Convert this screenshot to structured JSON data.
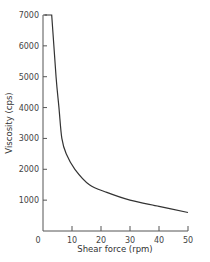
{
  "chart_data": {
    "type": "line",
    "title": "",
    "xlabel": "Shear force (rpm)",
    "ylabel": "Viscosity (cps)",
    "xlim": [
      0,
      50
    ],
    "ylim": [
      0,
      7000
    ],
    "x_ticks": [
      0,
      10,
      20,
      30,
      40,
      50
    ],
    "y_ticks": [
      1000,
      2000,
      3000,
      4000,
      5000,
      6000,
      7000
    ],
    "y_tick_labels": [
      "1000",
      "2000",
      "3000",
      "4000",
      "5000",
      "6000",
      "7000"
    ],
    "x_tick_labels": [
      "0",
      "10",
      "20",
      "30",
      "40",
      "50"
    ],
    "origin_label": "0",
    "grid": false,
    "legend": null,
    "series": [
      {
        "name": "Viscosity",
        "color": "#333333",
        "x": [
          0.5,
          3,
          4.5,
          5.5,
          6.5,
          8,
          11,
          16,
          22,
          30,
          40,
          50
        ],
        "y": [
          7000,
          7000,
          5000,
          4000,
          3000,
          2500,
          2000,
          1500,
          1250,
          1000,
          800,
          600
        ]
      }
    ]
  }
}
